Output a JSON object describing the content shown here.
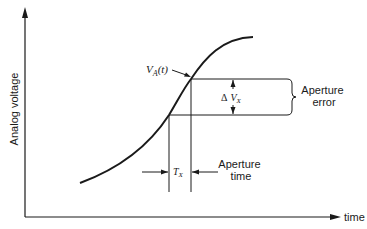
{
  "diagram": {
    "axes": {
      "y_label": "Analog voltage",
      "x_label": "time"
    },
    "curve": {
      "label_main": "V",
      "label_sub": "A",
      "label_arg": "(t)"
    },
    "delta": {
      "symbol": "Δ",
      "label_main": "V",
      "label_sub": "X"
    },
    "aperture_error": {
      "line1": "Aperture",
      "line2": "error"
    },
    "aperture_time": {
      "symbol_main": "T",
      "symbol_sub": "X",
      "line1": "Aperture",
      "line2": "time"
    },
    "colors": {
      "stroke": "#1a1a1a",
      "background": "#ffffff"
    }
  }
}
